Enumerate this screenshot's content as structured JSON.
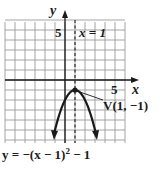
{
  "chart_data": {
    "type": "line",
    "title": "",
    "equation": "y = −(x − 1)² − 1",
    "xlabel": "x",
    "ylabel": "y",
    "xlim": [
      -6,
      6
    ],
    "ylim": [
      -6,
      6
    ],
    "grid": true,
    "tick_labels": {
      "x": [
        "5"
      ],
      "y": [
        "5"
      ]
    },
    "series": [
      {
        "name": "y = −(x − 1)² − 1",
        "x": [
          -1.3,
          -1,
          0,
          1,
          2,
          3,
          3.3
        ],
        "y": [
          -6.29,
          -5,
          -2,
          -1,
          -2,
          -5,
          -6.29
        ]
      }
    ],
    "annotations": [
      {
        "text": "x = 1",
        "type": "axis-of-symmetry",
        "x": 1
      },
      {
        "text": "V(1, −1)",
        "type": "vertex",
        "point": [
          1,
          -1
        ]
      }
    ]
  },
  "labels": {
    "y_axis": "y",
    "x_axis": "x",
    "y_tick": "5",
    "x_tick": "5",
    "symmetry": "x = 1",
    "vertex": "V(1, −1)",
    "equation_prefix": "y = −(x − 1)",
    "equation_exp": "2",
    "equation_suffix": " − 1"
  },
  "colors": {
    "grid": "#9a9a9a",
    "axis": "#1a1a1a",
    "curve": "#1a1a1a"
  }
}
